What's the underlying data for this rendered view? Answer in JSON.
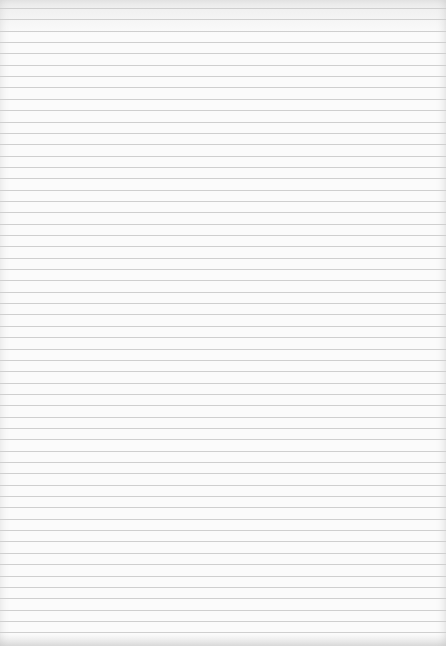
{
  "document": {
    "type": "lined-paper",
    "text": "",
    "colors": {
      "paper": "#fbfbfb",
      "rule": "#cfcfcf"
    },
    "rules": {
      "first_y": 8,
      "spacing": 11.35,
      "count": 56
    }
  }
}
